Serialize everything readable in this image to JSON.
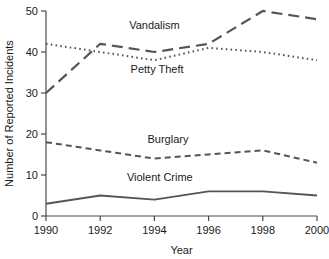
{
  "chart_data": {
    "type": "line",
    "title": "",
    "xlabel": "Year",
    "ylabel": "Number of Reported Incidents",
    "x": [
      1990,
      1992,
      1994,
      1996,
      1998,
      2000
    ],
    "xlim": [
      1990,
      2000
    ],
    "ylim": [
      0,
      50
    ],
    "xticks": [
      "1990",
      "1992",
      "1994",
      "1996",
      "1998",
      "2000"
    ],
    "yticks": [
      "0",
      "10",
      "20",
      "30",
      "40",
      "50"
    ],
    "grid": false,
    "legend": "inline-labels",
    "series": [
      {
        "name": "Vandalism",
        "values": [
          30,
          42,
          40,
          42,
          50,
          48
        ],
        "style": "long-dash",
        "color": "#555555"
      },
      {
        "name": "Petty Theft",
        "values": [
          42,
          40,
          38,
          41,
          40,
          38
        ],
        "style": "dotted",
        "color": "#555555"
      },
      {
        "name": "Burglary",
        "values": [
          18,
          16,
          14,
          15,
          16,
          13
        ],
        "style": "dashed",
        "color": "#555555"
      },
      {
        "name": "Violent Crime",
        "values": [
          3,
          5,
          4,
          6,
          6,
          5
        ],
        "style": "solid",
        "color": "#555555"
      }
    ],
    "annotations": [
      {
        "text": "Vandalism",
        "x": 1994.0,
        "y": 45.5
      },
      {
        "text": "Petty Theft",
        "x": 1994.1,
        "y": 35.0
      },
      {
        "text": "Burglary",
        "x": 1994.5,
        "y": 17.8
      },
      {
        "text": "Violent Crime",
        "x": 1994.2,
        "y": 8.6
      }
    ]
  },
  "axis": {
    "x_title": "Year",
    "y_title": "Number of Reported Incidents"
  }
}
